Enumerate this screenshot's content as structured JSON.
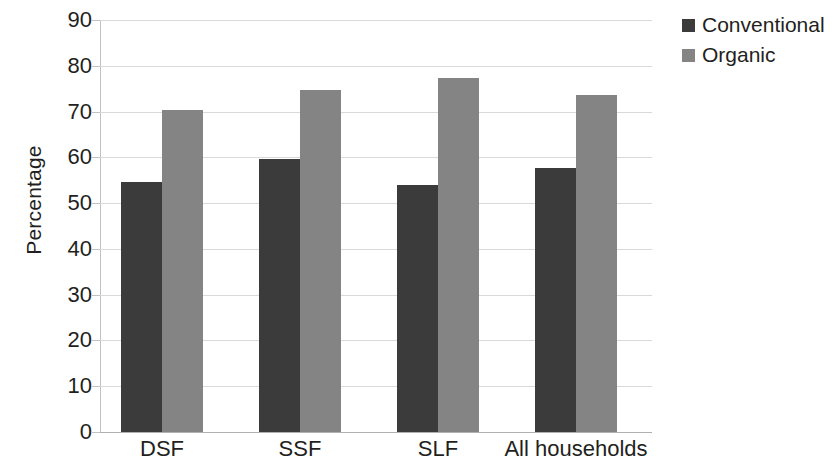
{
  "chart_data": {
    "type": "bar",
    "title": "",
    "subtitle": "",
    "xlabel": "",
    "ylabel": "Percentage",
    "categories": [
      "DSF",
      "SSF",
      "SLF",
      "All households"
    ],
    "series": [
      {
        "name": "Conventional",
        "color": "#3b3b3b",
        "values": [
          54.7,
          59.7,
          53.9,
          57.6
        ]
      },
      {
        "name": "Organic",
        "color": "#848484",
        "values": [
          70.3,
          74.8,
          77.3,
          73.6
        ]
      }
    ],
    "ylim": [
      0,
      90
    ],
    "y_ticks": [
      0,
      10,
      20,
      30,
      40,
      50,
      60,
      70,
      80,
      90
    ],
    "y_tick_labels": [
      "0",
      "10",
      "20",
      "30",
      "40",
      "50",
      "60",
      "70",
      "80",
      "90"
    ],
    "grid": "horizontal",
    "grid_color": "#d9d9d9",
    "legend_position": "top-right",
    "background": "#ffffff",
    "axis_color": "#c2c2c2",
    "text_color": "#231f20"
  },
  "legend": {
    "entries": [
      {
        "label": "Conventional",
        "color": "#3b3b3b"
      },
      {
        "label": "Organic",
        "color": "#848484"
      }
    ]
  },
  "axes": {
    "y_title": "Percentage"
  }
}
